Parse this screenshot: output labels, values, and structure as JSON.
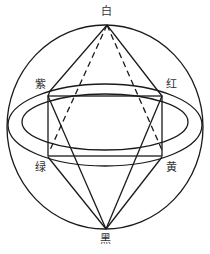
{
  "labels": {
    "top": "白",
    "bottom": "黑",
    "upper_left": "紫",
    "upper_right": "红",
    "lower_left": "绿",
    "lower_right": "黄"
  },
  "colors": {
    "stroke": "#1a1a1a",
    "background": "#ffffff",
    "label": "#333333"
  }
}
